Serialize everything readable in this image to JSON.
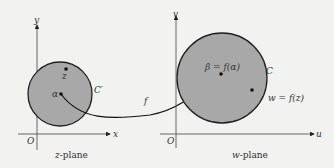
{
  "colors": {
    "background": "#f2f2f0",
    "disk_fill": "#a8a8a8",
    "stroke": "#222222"
  },
  "z_plane": {
    "x_axis_label": "x",
    "y_axis_label": "y",
    "origin_label": "O",
    "caption_var": "z",
    "caption_rest": "-plane",
    "curve_label": "C′",
    "point_alpha": "α",
    "point_z": "z"
  },
  "w_plane": {
    "x_axis_label": "u",
    "y_axis_label": "v",
    "origin_label": "O",
    "caption_var": "w",
    "caption_rest": "-plane",
    "curve_label": "C",
    "point_beta": "β = f(α)",
    "point_w": "w = f(z)"
  },
  "mapping_label": "f"
}
